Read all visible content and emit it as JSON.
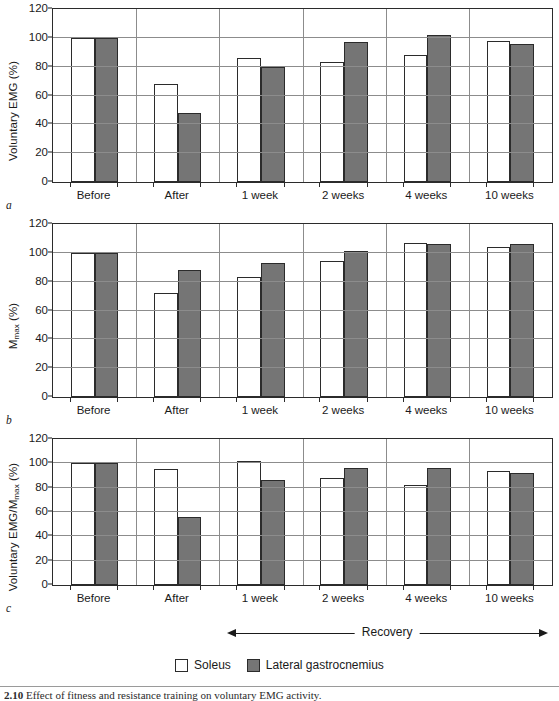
{
  "figure": {
    "legend": {
      "items": [
        {
          "label": "Soleus",
          "swatch": "white-square-icon",
          "color": "#ffffff"
        },
        {
          "label": "Lateral gastrocnemius",
          "swatch": "gray-square-icon",
          "color": "#757575"
        }
      ]
    },
    "recovery_annotation": {
      "label": "Recovery",
      "left_arrow": "arrow-left-icon",
      "right_arrow": "arrow-right-icon"
    },
    "caption": {
      "number": "2.10",
      "text": "Effect of fitness and resistance training on voluntary EMG activity."
    },
    "panel_letters": [
      "a",
      "b",
      "c"
    ]
  },
  "chart_data": [
    {
      "type": "bar",
      "panel": "a",
      "title": "",
      "xlabel": "",
      "ylabel": "Voluntary EMG (%)",
      "ylim": [
        0,
        120
      ],
      "yticks": [
        0,
        20,
        40,
        60,
        80,
        100,
        120
      ],
      "grid": true,
      "legend_position": "below-figure",
      "categories": [
        "Before",
        "After",
        "1 week",
        "2 weeks",
        "4 weeks",
        "10 weeks"
      ],
      "series": [
        {
          "name": "Soleus",
          "color": "#ffffff",
          "values": [
            100,
            68,
            86,
            83,
            88,
            98
          ]
        },
        {
          "name": "Lateral gastrocnemius",
          "color": "#757575",
          "values": [
            100,
            48,
            80,
            97,
            102,
            96
          ]
        }
      ]
    },
    {
      "type": "bar",
      "panel": "b",
      "title": "",
      "xlabel": "",
      "ylabel": "Mmax (%)",
      "ylabel_base": "M",
      "ylabel_sub": "max",
      "ylabel_unit": " (%)",
      "ylim": [
        0,
        120
      ],
      "yticks": [
        0,
        20,
        40,
        60,
        80,
        100,
        120
      ],
      "grid": true,
      "legend_position": "below-figure",
      "categories": [
        "Before",
        "After",
        "1 week",
        "2 weeks",
        "4 weeks",
        "10 weeks"
      ],
      "series": [
        {
          "name": "Soleus",
          "color": "#ffffff",
          "values": [
            100,
            72,
            83,
            94,
            107,
            104
          ]
        },
        {
          "name": "Lateral gastrocnemius",
          "color": "#757575",
          "values": [
            100,
            88,
            93,
            101,
            106,
            106
          ]
        }
      ]
    },
    {
      "type": "bar",
      "panel": "c",
      "title": "",
      "xlabel": "",
      "ylabel": "Voluntary EMG/Mmax (%)",
      "ylabel_base": "Voluntary EMG/M",
      "ylabel_sub": "max",
      "ylabel_unit": " (%)",
      "ylim": [
        0,
        120
      ],
      "yticks": [
        0,
        20,
        40,
        60,
        80,
        100,
        120
      ],
      "grid": true,
      "legend_position": "below-figure",
      "categories": [
        "Before",
        "After",
        "1 week",
        "2 weeks",
        "4 weeks",
        "10 weeks"
      ],
      "series": [
        {
          "name": "Soleus",
          "color": "#ffffff",
          "values": [
            100,
            95,
            102,
            88,
            82,
            94
          ]
        },
        {
          "name": "Lateral gastrocnemius",
          "color": "#757575",
          "values": [
            100,
            56,
            86,
            96,
            96,
            92
          ]
        }
      ]
    }
  ]
}
